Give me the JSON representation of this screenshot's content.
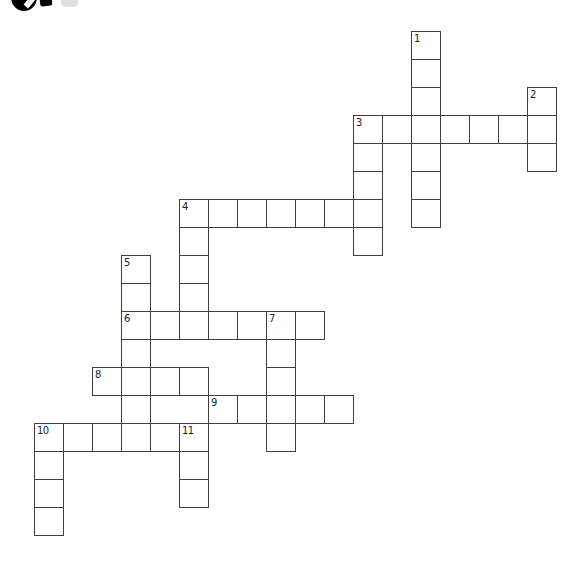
{
  "puzzle": {
    "kind": "crossword",
    "grid_size": {
      "rows": 18,
      "cols": 18
    },
    "colors": {
      "cell_border": "#3f3f3f",
      "cell_fill": "#ffffff",
      "number_color": "#222222",
      "page_background": "#ffffff",
      "logo_black": "#000000",
      "logo_faint_gray": "#dedede"
    },
    "entries": [
      {
        "number": 1,
        "direction": "down",
        "row": 0,
        "col": 13,
        "length": 7
      },
      {
        "number": 2,
        "direction": "down",
        "row": 2,
        "col": 17,
        "length": 3
      },
      {
        "number": 3,
        "direction": "across",
        "row": 3,
        "col": 11,
        "length": 7
      },
      {
        "number": 3,
        "direction": "down",
        "row": 3,
        "col": 11,
        "length": 5
      },
      {
        "number": 4,
        "direction": "across",
        "row": 6,
        "col": 5,
        "length": 7
      },
      {
        "number": 4,
        "direction": "down",
        "row": 6,
        "col": 5,
        "length": 5
      },
      {
        "number": 5,
        "direction": "down",
        "row": 8,
        "col": 3,
        "length": 7
      },
      {
        "number": 6,
        "direction": "across",
        "row": 10,
        "col": 3,
        "length": 7
      },
      {
        "number": 7,
        "direction": "down",
        "row": 10,
        "col": 8,
        "length": 5
      },
      {
        "number": 8,
        "direction": "across",
        "row": 12,
        "col": 2,
        "length": 4
      },
      {
        "number": 9,
        "direction": "across",
        "row": 13,
        "col": 6,
        "length": 5
      },
      {
        "number": 10,
        "direction": "across",
        "row": 14,
        "col": 0,
        "length": 6
      },
      {
        "number": 10,
        "direction": "down",
        "row": 14,
        "col": 0,
        "length": 4
      },
      {
        "number": 11,
        "direction": "down",
        "row": 14,
        "col": 5,
        "length": 3
      }
    ],
    "visible_cell_numbers": [
      "1",
      "2",
      "3",
      "4",
      "5",
      "6",
      "7",
      "8",
      "9",
      "10",
      "11"
    ]
  }
}
